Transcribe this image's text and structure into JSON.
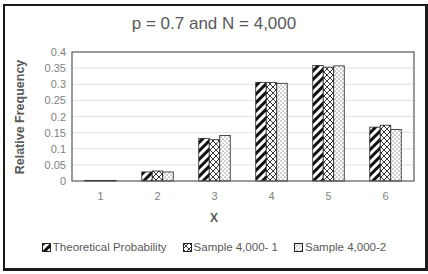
{
  "chart_data": {
    "type": "bar",
    "title": "p = 0.7 and N = 4,000",
    "xlabel": "X",
    "ylabel": "Relative Frequency",
    "categories": [
      "1",
      "2",
      "3",
      "4",
      "5",
      "6"
    ],
    "series": [
      {
        "name": "Theoretical Probability",
        "pattern": "diagonal-stripes",
        "values": [
          0.002,
          0.028,
          0.132,
          0.306,
          0.358,
          0.167
        ]
      },
      {
        "name": "Sample 4,000- 1",
        "pattern": "crosshatch",
        "values": [
          0.002,
          0.031,
          0.128,
          0.305,
          0.353,
          0.173
        ]
      },
      {
        "name": "Sample 4,000-2",
        "pattern": "dots",
        "values": [
          0.002,
          0.028,
          0.141,
          0.303,
          0.357,
          0.16
        ]
      }
    ],
    "ylim": [
      0,
      0.4
    ],
    "yticks": [
      "0",
      "0.05",
      "0.1",
      "0.15",
      "0.2",
      "0.25",
      "0.3",
      "0.35",
      "0.4"
    ],
    "grid": true,
    "legend_position": "bottom"
  },
  "title": "p = 0.7 and N = 4,000",
  "axes": {
    "ylabel": "Relative Frequency",
    "xlabel": "X",
    "yticks": [
      "0",
      "0.05",
      "0.1",
      "0.15",
      "0.2",
      "0.25",
      "0.3",
      "0.35",
      "0.4"
    ],
    "xticks": [
      "1",
      "2",
      "3",
      "4",
      "5",
      "6"
    ]
  },
  "legend": [
    {
      "label": "Theoretical Probability",
      "icon": "diagonal-stripes-swatch"
    },
    {
      "label": "Sample 4,000- 1",
      "icon": "crosshatch-swatch"
    },
    {
      "label": "Sample 4,000-2",
      "icon": "dots-swatch"
    }
  ],
  "colors": {
    "frame": "#1a1a1a",
    "text": "#595959",
    "tick": "#7f7f7f",
    "grid": "#d9d9d9",
    "bar_outline": "#222222"
  }
}
